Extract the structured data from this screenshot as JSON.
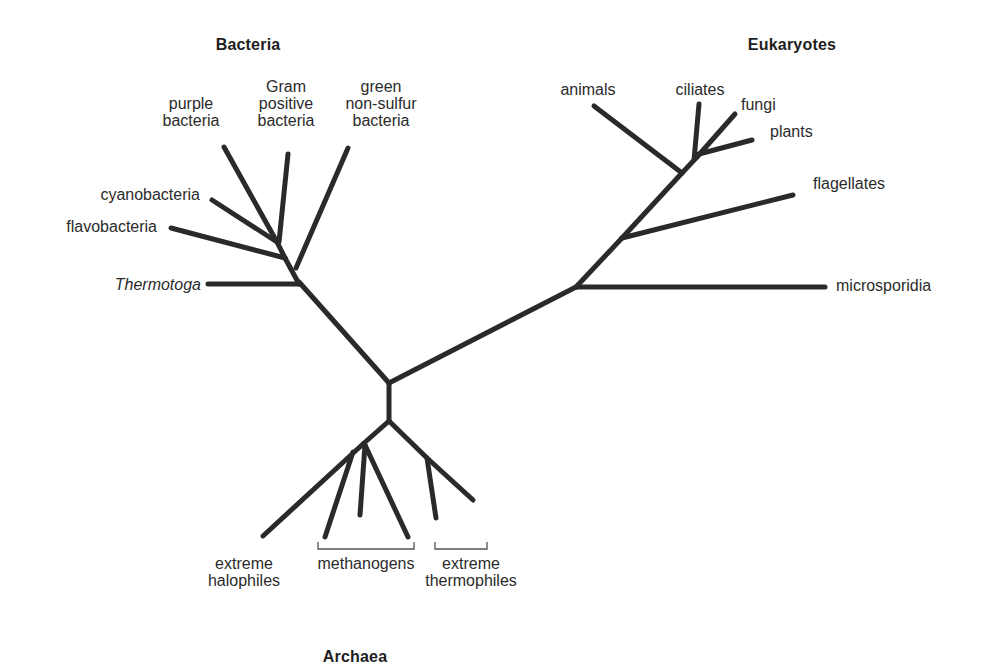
{
  "diagram": {
    "type": "unrooted phylogenetic tree",
    "groups": {
      "bacteria": "Bacteria",
      "eukaryotes": "Eukaryotes",
      "archaea": "Archaea"
    },
    "bacteria_leaves": {
      "purple_bacteria": [
        "purple",
        "bacteria"
      ],
      "gram_positive": [
        "Gram",
        "positive",
        "bacteria"
      ],
      "green_non_sulfur": [
        "green",
        "non-sulfur",
        "bacteria"
      ],
      "cyanobacteria": "cyanobacteria",
      "flavobacteria": "flavobacteria",
      "thermotoga": "Thermotoga"
    },
    "eukaryote_leaves": {
      "animals": "animals",
      "ciliates": "ciliates",
      "fungi": "fungi",
      "plants": "plants",
      "flagellates": "flagellates",
      "microsporidia": "microsporidia"
    },
    "archaea_leaves": {
      "extreme_halophiles": [
        "extreme",
        "halophiles"
      ],
      "methanogens": "methanogens",
      "extreme_thermophiles": [
        "extreme",
        "thermophiles"
      ]
    },
    "colors": {
      "branch": "#2a2a2a",
      "bracket": "#555555",
      "text": "#2b2b2b"
    }
  }
}
